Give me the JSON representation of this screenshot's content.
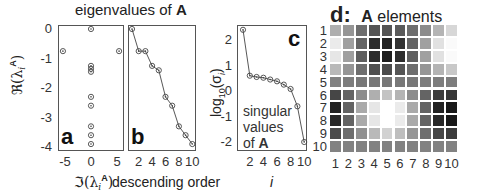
{
  "figure_title": {
    "text": "eigenvalues of ",
    "bold": "A"
  },
  "chart_data": [
    {
      "panel": "a",
      "type": "scatter",
      "title": "eigenvalues of A",
      "xlabel": "Im(λ_i^A)",
      "ylabel": "Re(λ_i^A)",
      "xlim": [
        -6,
        6
      ],
      "ylim": [
        -4.1,
        0.1
      ],
      "xticks": [
        "-5",
        "0",
        "5"
      ],
      "yticks": [
        "0",
        "-1",
        "-2",
        "-3",
        "-4"
      ],
      "points": [
        {
          "x": 0,
          "y": 0
        },
        {
          "x": -5.4,
          "y": -0.75
        },
        {
          "x": 5.4,
          "y": -0.75
        },
        {
          "x": 0,
          "y": -1.25
        },
        {
          "x": 0,
          "y": -1.35
        },
        {
          "x": 0,
          "y": -1.45
        },
        {
          "x": 0,
          "y": -2.3
        },
        {
          "x": 0,
          "y": -2.6
        },
        {
          "x": 0,
          "y": -3.3
        },
        {
          "x": 0,
          "y": -3.6
        },
        {
          "x": 0,
          "y": -3.9
        }
      ]
    },
    {
      "panel": "b",
      "type": "line",
      "xlabel": "descending order",
      "ylabel": "Re(λ_i^A)",
      "xlim": [
        0.5,
        10.5
      ],
      "ylim": [
        -4.1,
        0.1
      ],
      "xticks": [
        "2",
        "4",
        "6",
        "8",
        "10"
      ],
      "x": [
        1,
        2,
        3,
        4,
        5,
        6,
        7,
        8,
        9,
        10
      ],
      "values": [
        0,
        -0.75,
        -0.75,
        -1.25,
        -1.4,
        -2.3,
        -2.6,
        -3.3,
        -3.6,
        -3.9
      ]
    },
    {
      "panel": "c",
      "type": "line",
      "xlabel": "i",
      "ylabel": "log10(σ_i)",
      "annotation": "singular values of A",
      "xlim": [
        0.5,
        10.5
      ],
      "ylim": [
        -2.2,
        2.6
      ],
      "xticks": [
        "2",
        "4",
        "6",
        "8",
        "10"
      ],
      "yticks": [
        "2",
        "1",
        "0",
        "-1",
        "-2"
      ],
      "x": [
        1,
        2,
        3,
        4,
        5,
        6,
        7,
        8,
        9,
        10
      ],
      "values": [
        2.4,
        0.6,
        0.55,
        0.52,
        0.45,
        0.38,
        0.25,
        0.08,
        -0.6,
        -2.0
      ]
    },
    {
      "panel": "d",
      "type": "heatmap",
      "title": "d: A elements",
      "row_labels": [
        "1",
        "2",
        "3",
        "4",
        "5",
        "6",
        "7",
        "8",
        "9",
        "10"
      ],
      "col_labels": [
        "1",
        "2",
        "3",
        "4",
        "5",
        "6",
        "7",
        "8",
        "9",
        "10"
      ],
      "value_scale": "grayscale 0=black 255=white",
      "values": [
        [
          175,
          150,
          110,
          85,
          85,
          90,
          110,
          140,
          180,
          215
        ],
        [
          235,
          160,
          100,
          45,
          35,
          50,
          100,
          160,
          225,
          250
        ],
        [
          230,
          160,
          95,
          45,
          30,
          45,
          95,
          160,
          225,
          250
        ],
        [
          185,
          150,
          110,
          80,
          75,
          85,
          110,
          150,
          180,
          200
        ],
        [
          130,
          125,
          120,
          120,
          120,
          120,
          120,
          125,
          125,
          125
        ],
        [
          70,
          100,
          140,
          175,
          195,
          180,
          140,
          100,
          60,
          55
        ],
        [
          35,
          100,
          170,
          230,
          255,
          235,
          170,
          100,
          35,
          25
        ],
        [
          40,
          100,
          170,
          230,
          255,
          235,
          170,
          100,
          40,
          25
        ],
        [
          75,
          110,
          145,
          185,
          210,
          190,
          150,
          110,
          70,
          60
        ],
        [
          130,
          130,
          130,
          130,
          130,
          130,
          130,
          130,
          130,
          130
        ]
      ]
    }
  ],
  "labels": {
    "a": {
      "letter": "a",
      "yticks": [
        "0",
        "-1",
        "-2",
        "-3",
        "-4"
      ],
      "xticks": [
        "-5",
        "0",
        "5"
      ],
      "ylabel": "ℜ(λ",
      "xlabel": "ℑ(λ"
    },
    "b": {
      "letter": "b",
      "xticks": [
        "2",
        "4",
        "6",
        "8",
        "10"
      ],
      "xlabel": "descending order"
    },
    "c": {
      "letter": "c",
      "yticks": [
        "2",
        "1",
        "0",
        "-1",
        "-2"
      ],
      "xticks": [
        "2",
        "4",
        "6",
        "8",
        "10"
      ],
      "xlabel": "i",
      "ylabel": "log",
      "ann1": "singular",
      "ann2": "values",
      "ann3": "of ",
      "ann3b": "A"
    },
    "d": {
      "title_prefix": "d:",
      "title_bold": "A",
      "title_rest": " elements"
    }
  },
  "colors": {
    "axis": "#555555",
    "marker": "#444444",
    "line": "#444444"
  }
}
